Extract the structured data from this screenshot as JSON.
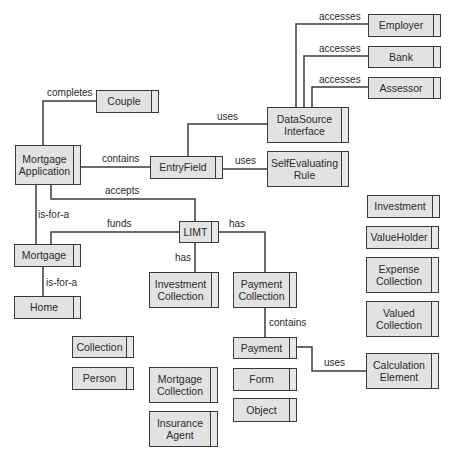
{
  "diagram": {
    "type": "class-relationship",
    "colors": {
      "box_fill": "#e2e2e2",
      "box_border": "#3a3a3a",
      "line": "#3a3a3a",
      "text": "#2a2a2a",
      "background": "#ffffff"
    },
    "nodes": [
      {
        "id": "employer",
        "label": "Employer",
        "x": 368,
        "y": 14,
        "w": 73,
        "h": 23
      },
      {
        "id": "bank",
        "label": "Bank",
        "x": 368,
        "y": 46,
        "w": 73,
        "h": 22
      },
      {
        "id": "assessor",
        "label": "Assessor",
        "x": 368,
        "y": 77,
        "w": 73,
        "h": 22
      },
      {
        "id": "couple",
        "label": "Couple",
        "x": 96,
        "y": 90,
        "w": 63,
        "h": 23
      },
      {
        "id": "datasource",
        "label": "DataSource\nInterface",
        "x": 267,
        "y": 107,
        "w": 82,
        "h": 36
      },
      {
        "id": "mortgage-application",
        "label": "Mortgage\nApplication",
        "x": 15,
        "y": 145,
        "w": 66,
        "h": 40
      },
      {
        "id": "entryfield",
        "label": "EntryField",
        "x": 150,
        "y": 156,
        "w": 73,
        "h": 23
      },
      {
        "id": "selfevaluating",
        "label": "SelfEvaluating\nRule",
        "x": 267,
        "y": 151,
        "w": 82,
        "h": 36
      },
      {
        "id": "investment",
        "label": "Investment",
        "x": 367,
        "y": 195,
        "w": 73,
        "h": 23
      },
      {
        "id": "limt",
        "label": "LIMT",
        "x": 179,
        "y": 221,
        "w": 40,
        "h": 22
      },
      {
        "id": "valueholder",
        "label": "ValueHolder",
        "x": 366,
        "y": 226,
        "w": 73,
        "h": 23
      },
      {
        "id": "mortgage",
        "label": "Mortgage",
        "x": 14,
        "y": 244,
        "w": 67,
        "h": 23
      },
      {
        "id": "expense-collection",
        "label": "Expense\nCollection",
        "x": 366,
        "y": 257,
        "w": 73,
        "h": 36
      },
      {
        "id": "investment-collection",
        "label": "Investment\nCollection",
        "x": 149,
        "y": 272,
        "w": 70,
        "h": 36
      },
      {
        "id": "payment-collection",
        "label": "Payment\nCollection",
        "x": 233,
        "y": 272,
        "w": 64,
        "h": 36
      },
      {
        "id": "home",
        "label": "Home",
        "x": 14,
        "y": 296,
        "w": 67,
        "h": 23
      },
      {
        "id": "valued-collection",
        "label": "Valued\nCollection",
        "x": 366,
        "y": 301,
        "w": 73,
        "h": 36
      },
      {
        "id": "collection",
        "label": "Collection",
        "x": 72,
        "y": 336,
        "w": 62,
        "h": 22
      },
      {
        "id": "payment",
        "label": "Payment",
        "x": 233,
        "y": 337,
        "w": 64,
        "h": 22
      },
      {
        "id": "calculation-element",
        "label": "Calculation\nElement",
        "x": 366,
        "y": 353,
        "w": 73,
        "h": 36
      },
      {
        "id": "person",
        "label": "Person",
        "x": 72,
        "y": 367,
        "w": 62,
        "h": 23
      },
      {
        "id": "mortgage-collection",
        "label": "Mortgage\nCollection",
        "x": 149,
        "y": 367,
        "w": 69,
        "h": 36
      },
      {
        "id": "form",
        "label": "Form",
        "x": 233,
        "y": 368,
        "w": 64,
        "h": 23
      },
      {
        "id": "object",
        "label": "Object",
        "x": 233,
        "y": 398,
        "w": 64,
        "h": 24
      },
      {
        "id": "insurance-agent",
        "label": "Insurance\nAgent",
        "x": 149,
        "y": 411,
        "w": 69,
        "h": 36
      }
    ],
    "edges": [
      {
        "from": "datasource",
        "to": "employer",
        "label": "accesses",
        "points": "296,107 296,24 368,24",
        "lx": 319,
        "ly": 11
      },
      {
        "from": "datasource",
        "to": "bank",
        "label": "accesses",
        "points": "304,107 304,56 368,56",
        "lx": 319,
        "ly": 43
      },
      {
        "from": "datasource",
        "to": "assessor",
        "label": "accesses",
        "points": "312,107 312,87 368,87",
        "lx": 319,
        "ly": 74
      },
      {
        "from": "mortgage-application",
        "to": "couple",
        "label": "completes",
        "points": "43,145 43,101 96,101",
        "lx": 47,
        "ly": 87
      },
      {
        "from": "entryfield",
        "to": "datasource",
        "label": "uses",
        "points": "188,156 188,124 267,124",
        "lx": 217,
        "ly": 111
      },
      {
        "from": "mortgage-application",
        "to": "entryfield",
        "label": "contains",
        "points": "81,167 150,167",
        "lx": 102,
        "ly": 153
      },
      {
        "from": "entryfield",
        "to": "selfevaluating",
        "label": "uses",
        "points": "223,169 267,169",
        "lx": 235,
        "ly": 155
      },
      {
        "from": "mortgage-application",
        "to": "limt",
        "label": "accepts",
        "points": "51,185 51,199 195,199 195,221",
        "lx": 105,
        "ly": 185
      },
      {
        "from": "mortgage-application",
        "to": "mortgage",
        "label": "is-for-a",
        "points": "36,185 36,244",
        "lx": 38,
        "ly": 209
      },
      {
        "from": "limt",
        "to": "mortgage",
        "label": "funds",
        "points": "179,232 51,232 51,244",
        "lx": 107,
        "ly": 218
      },
      {
        "from": "limt",
        "to": "payment-collection",
        "label": "has",
        "points": "219,232 265,232 265,272",
        "lx": 229,
        "ly": 218
      },
      {
        "from": "limt",
        "to": "investment-collection",
        "label": "has",
        "points": "195,243 195,272",
        "lx": 175,
        "ly": 252
      },
      {
        "from": "mortgage",
        "to": "home",
        "label": "is-for-a",
        "points": "43,267 43,296",
        "lx": 46,
        "ly": 277
      },
      {
        "from": "payment-collection",
        "to": "payment",
        "label": "contains",
        "points": "265,308 265,337",
        "lx": 269,
        "ly": 317
      },
      {
        "from": "payment",
        "to": "calculation-element",
        "label": "uses",
        "points": "297,347 312,347 312,371 366,371",
        "lx": 324,
        "ly": 357
      }
    ]
  }
}
